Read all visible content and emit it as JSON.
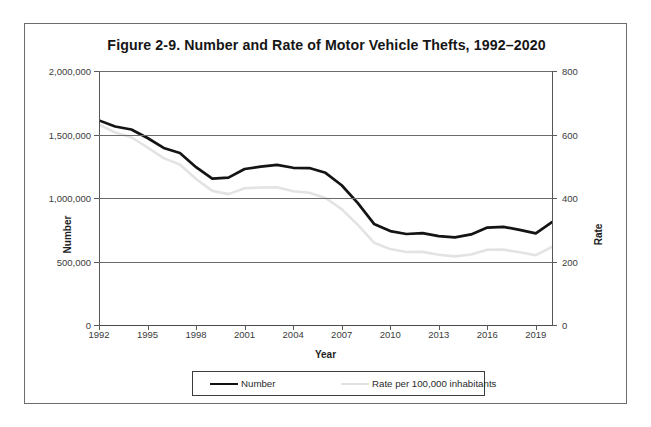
{
  "figure": {
    "title": "Figure 2-9. Number and Rate of Motor Vehicle Thefts, 1992–2020"
  },
  "axes": {
    "x_title": "Year",
    "y_left_title": "Number",
    "y_right_title": "Rate",
    "y_left_ticks": [
      "2,000,000",
      "1,500,000",
      "1,000,000",
      "500,000",
      "0"
    ],
    "y_right_ticks": [
      "800",
      "600",
      "400",
      "200",
      "0"
    ],
    "x_ticks": [
      "1992",
      "1995",
      "1998",
      "2001",
      "2004",
      "2007",
      "2010",
      "2013",
      "2016",
      "2019"
    ]
  },
  "legend": {
    "number_label": "Number",
    "rate_label": "Rate per 100,000 inhabitants"
  },
  "colors": {
    "number_line": "#141414",
    "rate_line": "#e3e3e3",
    "gridline": "#6b6b6b",
    "frame": "#6c6c6c",
    "background": "#ffffff"
  },
  "chart_data": {
    "type": "line",
    "title": "Figure 2-9. Number and Rate of Motor Vehicle Thefts, 1992–2020",
    "xlabel": "Year",
    "ylabel": "Number",
    "y2label": "Rate",
    "ylim": [
      0,
      2000000
    ],
    "y2lim": [
      0,
      800
    ],
    "xlim": [
      1992,
      2020
    ],
    "grid": true,
    "legend_position": "bottom",
    "x": [
      1992,
      1993,
      1994,
      1995,
      1996,
      1997,
      1998,
      1999,
      2000,
      2001,
      2002,
      2003,
      2004,
      2005,
      2006,
      2007,
      2008,
      2009,
      2010,
      2011,
      2012,
      2013,
      2014,
      2015,
      2016,
      2017,
      2018,
      2019,
      2020
    ],
    "series": [
      {
        "name": "Number",
        "axis": "left",
        "color": "#141414",
        "values": [
          1610834,
          1563060,
          1539287,
          1472441,
          1394238,
          1354189,
          1242781,
          1152075,
          1160002,
          1228391,
          1246646,
          1261226,
          1237851,
          1235859,
          1198245,
          1100472,
          959059,
          795652,
          739565,
          716508,
          723186,
          700294,
          689527,
          713063,
          767290,
          773139,
          748841,
          721885,
          810400
        ]
      },
      {
        "name": "Rate per 100,000 inhabitants",
        "axis": "right",
        "color": "#e3e3e3",
        "values": [
          631.6,
          606.3,
          591.3,
          559.1,
          525.7,
          505.7,
          459.9,
          422.5,
          412.2,
          430.5,
          432.9,
          433.7,
          421.5,
          416.8,
          400.0,
          364.9,
          315.4,
          259.2,
          239.1,
          230.0,
          230.4,
          221.3,
          216.2,
          222.0,
          236.9,
          237.4,
          228.9,
          219.9,
          246.0
        ]
      }
    ]
  }
}
